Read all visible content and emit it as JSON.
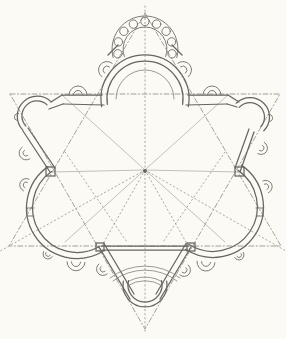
{
  "canvas": {
    "width": 286,
    "height": 339,
    "paper": "#fbfaf5"
  },
  "palette": {
    "ink_wall": "#67665e",
    "ink_thin": "#76756c",
    "ink_step": "#8b897d",
    "ink_light": "#aba797",
    "ink_dash": "#94928a",
    "ink_dashdot": "#8c8a80"
  },
  "diagram": {
    "kind": "architectural-floor-plan",
    "styles": {
      "wall": {
        "stroke": "#67665e",
        "width": 1.25
      },
      "thin": {
        "stroke": "#76756c",
        "width": 0.95
      },
      "step": {
        "stroke": "#8b897d",
        "width": 0.85
      },
      "light": {
        "stroke": "#aba797",
        "width": 0.7
      },
      "dash": {
        "stroke": "#94928a",
        "width": 0.8,
        "dash": "1.3 2.8"
      },
      "dashdot": {
        "stroke": "#8c8a80",
        "width": 0.8,
        "dash": "5 2.4 1.2 2.4"
      }
    },
    "elements": [
      {
        "n": "construction-triangle-down",
        "k": "pline",
        "pts": [
          [
            10,
            94
          ],
          [
            280,
            94
          ],
          [
            145,
            329
          ],
          [
            10,
            94
          ]
        ],
        "c": "dashdot"
      },
      {
        "n": "construction-triangle-up",
        "k": "pline",
        "pts": [
          [
            145,
            13
          ],
          [
            281,
            246
          ],
          [
            9,
            246
          ],
          [
            145,
            13
          ]
        ],
        "c": "dashdot"
      },
      {
        "n": "construction-vertical-axis",
        "k": "line",
        "p": [
          145,
          6,
          145,
          333
        ],
        "c": "dash"
      },
      {
        "n": "construction-radial-lower-left",
        "k": "line",
        "p": [
          145,
          170,
          0,
          251
        ],
        "c": "dash"
      },
      {
        "n": "construction-radial-lower-right",
        "k": "line",
        "p": [
          145,
          170,
          286,
          251
        ],
        "c": "dash"
      },
      {
        "n": "construction-diagonal-left",
        "k": "line",
        "p": [
          62,
          95,
          225,
          242
        ],
        "c": "light"
      },
      {
        "n": "construction-diagonal-right",
        "k": "line",
        "p": [
          228,
          95,
          65,
          242
        ],
        "c": "light"
      },
      {
        "n": "construction-radial-left",
        "k": "line",
        "p": [
          145,
          170,
          52,
          172
        ],
        "c": "light"
      },
      {
        "n": "construction-radial-right",
        "k": "line",
        "p": [
          145,
          170,
          238,
          172
        ],
        "c": "light"
      },
      {
        "n": "construction-radial-sanctuary-left",
        "k": "line",
        "p": [
          145,
          170,
          100,
          249
        ],
        "c": "dash"
      },
      {
        "n": "construction-radial-sanctuary-right",
        "k": "line",
        "p": [
          145,
          170,
          190,
          249
        ],
        "c": "dash"
      },
      {
        "n": "construction-diagonal-extra-left",
        "k": "line",
        "p": [
          65,
          152,
          127,
          242
        ],
        "c": "dash"
      },
      {
        "n": "construction-diagonal-extra-right",
        "k": "line",
        "p": [
          225,
          152,
          163,
          242
        ],
        "c": "dash"
      },
      {
        "n": "center-point",
        "k": "dot",
        "p": [
          145,
          171,
          1.3
        ],
        "c": "wall"
      },
      {
        "n": "main-apse-outer-wall",
        "k": "arc",
        "a": [
          145,
          99,
          44,
          170,
          370,
          1
        ],
        "c": "wall"
      },
      {
        "n": "main-apse-inner-wall",
        "k": "arc",
        "a": [
          145,
          99,
          38,
          172,
          368,
          1
        ],
        "c": "wall"
      },
      {
        "n": "main-apse-step",
        "k": "arc",
        "a": [
          145,
          99,
          29,
          180,
          360,
          1
        ],
        "c": "step"
      },
      {
        "n": "colonnade-outer-ring",
        "k": "arc",
        "a": [
          145,
          49,
          33,
          165,
          375,
          1
        ],
        "c": "thin"
      },
      {
        "n": "colonnade-inner-ring",
        "k": "arc",
        "a": [
          145,
          49,
          22,
          160,
          380,
          1
        ],
        "c": "thin"
      },
      {
        "n": "colonnade-column",
        "k": "circle",
        "p": [
          117.9,
          53.8,
          4.2
        ],
        "c": "thin"
      },
      {
        "n": "colonnade-column",
        "k": "circle",
        "p": [
          118.4,
          41.9,
          4.2
        ],
        "c": "thin"
      },
      {
        "n": "colonnade-column",
        "k": "circle",
        "p": [
          123.9,
          31.3,
          4.2
        ],
        "c": "thin"
      },
      {
        "n": "colonnade-column",
        "k": "circle",
        "p": [
          133.4,
          24.1,
          4.2
        ],
        "c": "thin"
      },
      {
        "n": "colonnade-column",
        "k": "circle",
        "p": [
          145,
          21.5,
          4.2
        ],
        "c": "thin"
      },
      {
        "n": "colonnade-column",
        "k": "circle",
        "p": [
          156.6,
          24.1,
          4.2
        ],
        "c": "thin"
      },
      {
        "n": "colonnade-column",
        "k": "circle",
        "p": [
          166.1,
          31.3,
          4.2
        ],
        "c": "thin"
      },
      {
        "n": "colonnade-column",
        "k": "circle",
        "p": [
          171.6,
          41.9,
          4.2
        ],
        "c": "thin"
      },
      {
        "n": "colonnade-column",
        "k": "circle",
        "p": [
          172.1,
          53.8,
          4.2
        ],
        "c": "thin"
      },
      {
        "n": "colonnade-end-tick-left",
        "k": "line",
        "p": [
          108,
          55,
          118,
          45
        ],
        "c": "wall"
      },
      {
        "n": "colonnade-end-tick-right",
        "k": "line",
        "p": [
          172,
          45,
          182,
          55
        ],
        "c": "wall"
      },
      {
        "n": "apse-flank-niche-left",
        "k": "niche",
        "a": [
          107,
          70,
          8.5,
          4,
          217
        ],
        "c": "thin"
      },
      {
        "n": "apse-flank-niche-right",
        "k": "niche",
        "a": [
          183,
          70,
          8.5,
          4,
          323
        ],
        "c": "thin"
      },
      {
        "n": "north-wall-left-outer",
        "k": "line",
        "p": [
          62,
          95,
          102,
          95
        ],
        "c": "wall"
      },
      {
        "n": "north-wall-left-inner",
        "k": "line",
        "p": [
          63,
          104,
          104,
          105
        ],
        "c": "wall"
      },
      {
        "n": "north-wall-right-outer",
        "k": "line",
        "p": [
          188,
          95,
          228,
          95
        ],
        "c": "wall"
      },
      {
        "n": "north-wall-right-inner",
        "k": "line",
        "p": [
          186,
          105,
          227,
          104
        ],
        "c": "wall"
      },
      {
        "n": "north-niche-left",
        "k": "niche",
        "a": [
          78,
          95,
          9,
          4.5,
          270
        ],
        "c": "thin"
      },
      {
        "n": "north-niche-right",
        "k": "niche",
        "a": [
          212,
          95,
          9,
          4.5,
          270
        ],
        "c": "thin"
      },
      {
        "n": "north-wall-left-corner-outer",
        "k": "line",
        "p": [
          62,
          95,
          51,
          102
        ],
        "c": "wall"
      },
      {
        "n": "north-wall-left-corner-inner",
        "k": "line",
        "p": [
          63,
          104,
          49,
          109
        ],
        "c": "wall"
      },
      {
        "n": "north-wall-right-corner-outer",
        "k": "line",
        "p": [
          228,
          95,
          239,
          102
        ],
        "c": "wall"
      },
      {
        "n": "north-wall-right-corner-inner",
        "k": "line",
        "p": [
          227,
          104,
          237,
          107
        ],
        "c": "wall"
      },
      {
        "n": "chapel-upper-left-outer",
        "k": "arc",
        "a": [
          37,
          116,
          20,
          135,
          315,
          1
        ],
        "c": "wall"
      },
      {
        "n": "chapel-upper-left-inner",
        "k": "arc",
        "a": [
          37,
          116,
          15,
          138,
          312,
          1
        ],
        "c": "wall"
      },
      {
        "n": "chapel-upper-left-niche",
        "k": "niche",
        "a": [
          18,
          117,
          3.5,
          0,
          190
        ],
        "c": "thin"
      },
      {
        "n": "wall-upper-left-outer",
        "k": "line",
        "p": [
          23,
          131,
          50,
          172
        ],
        "c": "wall"
      },
      {
        "n": "wall-upper-left-inner",
        "k": "line",
        "p": [
          28,
          128,
          55,
          168
        ],
        "c": "wall"
      },
      {
        "n": "wall-upper-left-niche",
        "k": "niche",
        "a": [
          26,
          153,
          7,
          3,
          147
        ],
        "c": "thin"
      },
      {
        "n": "chapel-upper-right-outer",
        "k": "arc",
        "a": [
          250,
          117,
          19.5,
          45,
          -135,
          0
        ],
        "c": "wall"
      },
      {
        "n": "chapel-upper-right-inner",
        "k": "arc",
        "a": [
          250,
          117,
          14.5,
          42,
          -138,
          0
        ],
        "c": "wall"
      },
      {
        "n": "chapel-upper-right-niche",
        "k": "niche",
        "a": [
          269,
          118,
          3.5,
          0,
          350
        ],
        "c": "thin"
      },
      {
        "n": "wall-upper-right-outer",
        "k": "line",
        "p": [
          254,
          132,
          240,
          172
        ],
        "c": "wall"
      },
      {
        "n": "wall-upper-right-inner",
        "k": "line",
        "p": [
          249,
          129,
          235,
          168
        ],
        "c": "wall"
      },
      {
        "n": "wall-upper-right-niche",
        "k": "niche",
        "a": [
          261,
          148,
          6.5,
          3,
          30
        ],
        "c": "thin"
      },
      {
        "n": "exedra-lower-left-outer",
        "k": "arc",
        "a": [
          77,
          208,
          50.5,
          235,
          60,
          0
        ],
        "c": "wall"
      },
      {
        "n": "exedra-lower-left-inner",
        "k": "arc",
        "a": [
          77,
          208,
          44.5,
          235,
          60,
          0
        ],
        "c": "wall"
      },
      {
        "n": "exedra-lower-left-niche-upper",
        "k": "niche",
        "a": [
          26.2,
          185,
          6.5,
          3,
          205
        ],
        "c": "thin"
      },
      {
        "n": "exedra-lower-left-nub",
        "k": "pline",
        "pts": [
          [
            34,
            208
          ],
          [
            27,
            208
          ],
          [
            27,
            216
          ],
          [
            34,
            216
          ]
        ],
        "c": "thin"
      },
      {
        "n": "exedra-lower-left-niche-lower",
        "k": "niche",
        "a": [
          48,
          254,
          5,
          2.5,
          122
        ],
        "c": "thin"
      },
      {
        "n": "exedra-lower-left-niche-bottom",
        "k": "niche",
        "a": [
          76,
          262,
          9,
          4.5,
          92
        ],
        "c": "thin"
      },
      {
        "n": "exedra-lower-right-outer",
        "k": "arc",
        "a": [
          213,
          207,
          50.5,
          -56,
          123,
          1
        ],
        "c": "wall"
      },
      {
        "n": "exedra-lower-right-inner",
        "k": "arc",
        "a": [
          213,
          207,
          44.5,
          -56,
          123,
          1
        ],
        "c": "wall"
      },
      {
        "n": "exedra-lower-right-niche-upper",
        "k": "niche",
        "a": [
          265.7,
          186.8,
          6.5,
          3,
          335
        ],
        "c": "thin"
      },
      {
        "n": "exedra-lower-right-nub",
        "k": "pline",
        "pts": [
          [
            256,
            208
          ],
          [
            263,
            208
          ],
          [
            263,
            216
          ],
          [
            256,
            216
          ]
        ],
        "c": "thin"
      },
      {
        "n": "exedra-lower-right-niche-lower",
        "k": "niche",
        "a": [
          239,
          255,
          5,
          2.5,
          60
        ],
        "c": "thin"
      },
      {
        "n": "exedra-lower-right-niche-bottom",
        "k": "niche",
        "a": [
          206,
          262,
          9,
          4.5,
          95
        ],
        "c": "thin"
      },
      {
        "n": "sanctuary-wall-left-outer",
        "k": "line",
        "p": [
          99,
          247,
          130,
          299
        ],
        "c": "wall"
      },
      {
        "n": "sanctuary-wall-left-inner",
        "k": "line",
        "p": [
          104,
          243.5,
          134,
          294
        ],
        "c": "wall"
      },
      {
        "n": "sanctuary-wall-right-outer",
        "k": "line",
        "p": [
          191,
          247,
          160,
          299
        ],
        "c": "wall"
      },
      {
        "n": "sanctuary-wall-right-inner",
        "k": "line",
        "p": [
          186,
          243.5,
          156,
          294
        ],
        "c": "wall"
      },
      {
        "n": "sanctuary-mouth-outer",
        "k": "line",
        "p": [
          101,
          246,
          189,
          246
        ],
        "c": "wall"
      },
      {
        "n": "sanctuary-mouth-inner",
        "k": "line",
        "p": [
          102,
          250,
          188,
          250
        ],
        "c": "wall"
      },
      {
        "n": "sanctuary-step-outer",
        "k": "arc",
        "a": [
          145,
          323,
          57,
          232,
          308,
          1
        ],
        "c": "step"
      },
      {
        "n": "sanctuary-step-inner",
        "k": "arc",
        "a": [
          145,
          322,
          52,
          232,
          308,
          1
        ],
        "c": "step"
      },
      {
        "n": "altar-platform-outer",
        "k": "arc",
        "a": [
          145,
          310,
          33,
          235,
          305,
          1
        ],
        "c": "step"
      },
      {
        "n": "altar-platform-inner",
        "k": "arc",
        "a": [
          145,
          312,
          31.4,
          237,
          303,
          1
        ],
        "c": "step"
      },
      {
        "n": "south-apse-outer",
        "k": "arc",
        "a": [
          145,
          285,
          22,
          190,
          -10,
          0
        ],
        "c": "wall"
      },
      {
        "n": "south-apse-inner",
        "k": "arc",
        "a": [
          145,
          285,
          17,
          195,
          -15,
          0
        ],
        "c": "wall"
      },
      {
        "n": "sanctuary-niche-left",
        "k": "niche",
        "a": [
          103,
          269,
          6.5,
          3,
          140
        ],
        "c": "thin"
      },
      {
        "n": "sanctuary-niche-right",
        "k": "niche",
        "a": [
          184,
          270,
          6.5,
          3,
          40
        ],
        "c": "thin"
      },
      {
        "n": "pier-left-vertex",
        "k": "rect",
        "p": [
          46,
          167,
          9,
          9
        ],
        "c": "wall"
      },
      {
        "n": "pier-right-vertex",
        "k": "rect",
        "p": [
          235,
          167,
          9,
          9
        ],
        "c": "wall"
      },
      {
        "n": "pier-lower-left",
        "k": "rect",
        "p": [
          96,
          243,
          8,
          8
        ],
        "c": "wall"
      },
      {
        "n": "pier-lower-right",
        "k": "rect",
        "p": [
          187,
          243,
          8,
          8
        ],
        "c": "wall"
      }
    ]
  }
}
